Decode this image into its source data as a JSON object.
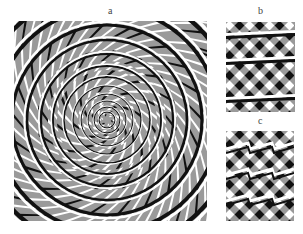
{
  "figure": {
    "panels": [
      {
        "label": "a",
        "description": "Concentric circles appearing as a spiral over a twisted checkerboard background"
      },
      {
        "label": "b",
        "description": "Straight horizontal bands appearing tilted over a diagonal checker pattern"
      },
      {
        "label": "c",
        "description": "Straight bands appearing as zigzags over a diagonal checker pattern"
      }
    ],
    "colors": {
      "background": "#ffffff",
      "gray": "#9a9a9a",
      "black": "#111111",
      "white": "#ffffff"
    }
  }
}
